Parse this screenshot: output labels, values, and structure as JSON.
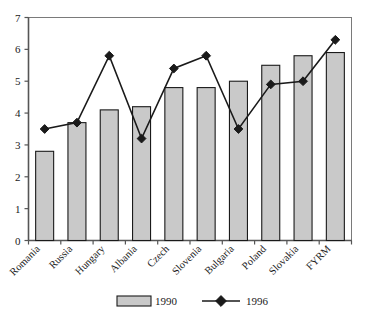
{
  "chart_data": {
    "type": "bar",
    "title": "",
    "subtitle": "",
    "xlabel": "",
    "ylabel": "",
    "ylim": [
      0,
      7
    ],
    "ytick_labels": [
      "0",
      "1",
      "2",
      "3",
      "4",
      "5",
      "6",
      "7"
    ],
    "ytick_values": [
      0,
      1,
      2,
      3,
      4,
      5,
      6,
      7
    ],
    "grid": false,
    "legend_position": "bottom",
    "categories": [
      "Romania",
      "Russia",
      "Hungary",
      "Albania",
      "Czech",
      "Slovenia",
      "Bulgaria",
      "Poland",
      "Slovakia",
      "FYRM"
    ],
    "series": [
      {
        "name": "1990",
        "type": "bar",
        "values": [
          2.8,
          3.7,
          4.1,
          4.2,
          4.8,
          4.8,
          5.0,
          5.5,
          5.8,
          5.9
        ],
        "fill_color": "#c9c9c9",
        "edge_color": "#1a1a1a"
      },
      {
        "name": "1996",
        "type": "line",
        "values": [
          3.5,
          3.7,
          5.8,
          3.2,
          5.4,
          5.8,
          3.5,
          4.9,
          5.0,
          6.3
        ],
        "line_color": "#1a1a1a",
        "marker": "diamond",
        "marker_color": "#1a1a1a"
      }
    ]
  },
  "legend": {
    "items": [
      {
        "label": "1990",
        "swatch": "bar-swatch"
      },
      {
        "label": "1996",
        "swatch": "line-marker-swatch"
      }
    ]
  },
  "colors": {
    "bar_fill": "#c9c9c9",
    "bar_edge": "#1a1a1a",
    "line": "#1a1a1a",
    "axis": "#555555",
    "frame": "#7a7a7a",
    "background": "#ffffff"
  }
}
